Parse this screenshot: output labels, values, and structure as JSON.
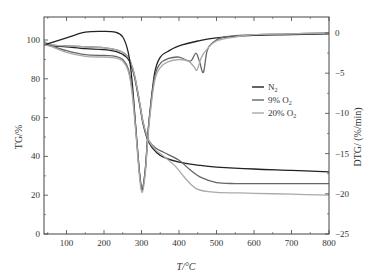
{
  "chart_data": {
    "type": "line",
    "title": "",
    "xlabel": "T/°C",
    "ylabel_left": "TG/%",
    "ylabel_right": "DTG/ (%/min)",
    "xlim": [
      40,
      800
    ],
    "ylim_left": [
      0,
      110
    ],
    "ylim_right": [
      -25,
      2
    ],
    "xticks": [
      100,
      200,
      300,
      400,
      500,
      600,
      700,
      800
    ],
    "yticks_left": [
      0,
      20,
      40,
      60,
      80,
      100
    ],
    "yticks_right": [
      0,
      -5,
      -10,
      -15,
      -20,
      -25
    ],
    "grid": false,
    "legend": {
      "position": "center-right",
      "entries": [
        "N2",
        "9% O2",
        "20% O2"
      ]
    },
    "series": [
      {
        "name": "N2",
        "kind": "TG",
        "axis": "left",
        "color": "#222222",
        "x": [
          40,
          60,
          100,
          150,
          200,
          240,
          265,
          280,
          295,
          305,
          320,
          340,
          360,
          400,
          450,
          500,
          600,
          700,
          800
        ],
        "y": [
          99,
          97,
          96.5,
          95.5,
          95,
          93.5,
          90,
          82,
          67,
          56,
          47,
          42,
          39.5,
          37,
          35.5,
          34.5,
          33.5,
          32.8,
          32
        ]
      },
      {
        "name": "9% O2",
        "kind": "TG",
        "axis": "left",
        "color": "#666666",
        "x": [
          40,
          60,
          100,
          150,
          200,
          240,
          265,
          280,
          295,
          305,
          320,
          340,
          360,
          400,
          430,
          460,
          500,
          550,
          600,
          700,
          800
        ],
        "y": [
          99,
          97.5,
          97,
          96.5,
          96,
          94.5,
          91,
          83,
          68,
          57,
          48,
          44,
          42,
          38,
          33,
          29,
          26.5,
          26,
          26,
          26,
          26
        ]
      },
      {
        "name": "20% O2",
        "kind": "TG",
        "axis": "left",
        "color": "#aaaaaa",
        "x": [
          40,
          60,
          100,
          150,
          200,
          240,
          265,
          280,
          295,
          305,
          320,
          340,
          360,
          390,
          420,
          450,
          500,
          600,
          700,
          800
        ],
        "y": [
          99,
          97.5,
          97,
          96.5,
          96,
          94.5,
          91,
          83,
          68,
          57,
          48,
          43,
          40,
          35,
          28,
          23,
          21.5,
          21,
          20.5,
          20
        ]
      },
      {
        "name": "N2",
        "kind": "DTG",
        "axis": "right",
        "color": "#222222",
        "x": [
          40,
          60,
          100,
          150,
          200,
          230,
          250,
          265,
          275,
          285,
          295,
          302,
          310,
          320,
          335,
          350,
          370,
          400,
          450,
          500,
          600,
          700,
          800
        ],
        "y": [
          -1.5,
          -1.2,
          -0.6,
          0.1,
          0.2,
          0.1,
          -0.5,
          -2.5,
          -6,
          -12,
          -17.5,
          -19.5,
          -17,
          -11,
          -5,
          -3,
          -2.3,
          -1.6,
          -1,
          -0.6,
          -0.3,
          -0.2,
          -0.1
        ]
      },
      {
        "name": "9% O2",
        "kind": "DTG",
        "axis": "right",
        "color": "#666666",
        "x": [
          40,
          60,
          100,
          150,
          200,
          230,
          250,
          265,
          275,
          285,
          295,
          302,
          310,
          320,
          335,
          350,
          370,
          400,
          430,
          445,
          455,
          465,
          475,
          490,
          520,
          600,
          700,
          800
        ],
        "y": [
          -1.5,
          -1.6,
          -2.2,
          -2.7,
          -2.8,
          -2.9,
          -3.3,
          -4.5,
          -7,
          -12,
          -17.5,
          -19.3,
          -17,
          -11,
          -5.5,
          -3.8,
          -3.2,
          -3,
          -3.5,
          -2.5,
          -3.6,
          -4.9,
          -2.2,
          -1.2,
          -0.5,
          -0.2,
          -0.1,
          0
        ]
      },
      {
        "name": "20% O2",
        "kind": "DTG",
        "axis": "right",
        "color": "#aaaaaa",
        "x": [
          40,
          60,
          100,
          150,
          200,
          230,
          250,
          265,
          275,
          285,
          295,
          302,
          310,
          320,
          335,
          350,
          370,
          400,
          425,
          440,
          448,
          460,
          475,
          500,
          550,
          600,
          700,
          800
        ],
        "y": [
          -1.5,
          -1.7,
          -2.4,
          -2.9,
          -3.0,
          -3.1,
          -3.5,
          -4.8,
          -7.5,
          -12.5,
          -18,
          -19.8,
          -17.5,
          -11.5,
          -6,
          -4.3,
          -3.6,
          -3.3,
          -3.5,
          -4.2,
          -4.6,
          -3,
          -2,
          -1,
          -0.5,
          -0.2,
          -0.1,
          0
        ]
      }
    ]
  }
}
